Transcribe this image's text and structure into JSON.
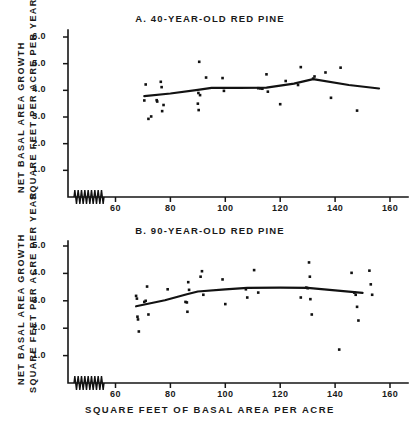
{
  "figure": {
    "xlabel": "SQUARE FEET OF BASAL AREA PER ACRE",
    "ylabel_line1": "NET BASAL AREA  GROWTH",
    "ylabel_line2": "SQUARE FEET PER ACRE PER YEAR",
    "ink_color": "#121212",
    "background": "#ffffff"
  },
  "chart_data": [
    {
      "type": "scatter",
      "title": "A.  40-YEAR-OLD RED PINE",
      "xlabel": "SQUARE FEET OF BASAL AREA PER ACRE",
      "ylabel": "NET BASAL AREA GROWTH, SQUARE FEET PER ACRE PER YEAR",
      "xlim": [
        52,
        165
      ],
      "ylim": [
        0,
        6.6
      ],
      "xticks": [
        60,
        80,
        100,
        120,
        140,
        160
      ],
      "yticks": [
        1.0,
        2.0,
        3.0,
        4.0,
        5.0,
        6.0
      ],
      "xtick_labels": [
        "60",
        "80",
        "100",
        "120",
        "140",
        "160"
      ],
      "ytick_labels": [
        "1.0",
        "2.0",
        "3.0",
        "4.0",
        "5.0",
        "6.0"
      ],
      "grid": false,
      "legend": "none",
      "axis_break": true,
      "points": [
        {
          "x": 71.0,
          "y": 4.22
        },
        {
          "x": 70.5,
          "y": 3.62
        },
        {
          "x": 72.0,
          "y": 2.93
        },
        {
          "x": 73.0,
          "y": 3.02
        },
        {
          "x": 75.0,
          "y": 3.63
        },
        {
          "x": 75.2,
          "y": 3.58
        },
        {
          "x": 76.5,
          "y": 4.32
        },
        {
          "x": 76.8,
          "y": 4.12
        },
        {
          "x": 77.0,
          "y": 3.22
        },
        {
          "x": 77.5,
          "y": 3.45
        },
        {
          "x": 90.5,
          "y": 5.07
        },
        {
          "x": 90.2,
          "y": 3.9
        },
        {
          "x": 90.8,
          "y": 3.82
        },
        {
          "x": 90.0,
          "y": 3.5
        },
        {
          "x": 90.3,
          "y": 3.26
        },
        {
          "x": 93.0,
          "y": 4.48
        },
        {
          "x": 99.0,
          "y": 4.46
        },
        {
          "x": 99.5,
          "y": 3.98
        },
        {
          "x": 112.0,
          "y": 4.08
        },
        {
          "x": 112.8,
          "y": 4.07
        },
        {
          "x": 113.5,
          "y": 4.06
        },
        {
          "x": 115.0,
          "y": 4.6
        },
        {
          "x": 115.5,
          "y": 3.95
        },
        {
          "x": 120.0,
          "y": 3.48
        },
        {
          "x": 122.0,
          "y": 4.35
        },
        {
          "x": 126.5,
          "y": 4.2
        },
        {
          "x": 127.5,
          "y": 4.87
        },
        {
          "x": 132.0,
          "y": 4.44
        },
        {
          "x": 132.5,
          "y": 4.52
        },
        {
          "x": 136.5,
          "y": 4.67
        },
        {
          "x": 138.5,
          "y": 3.72
        },
        {
          "x": 142.0,
          "y": 4.85
        },
        {
          "x": 148.0,
          "y": 3.24
        }
      ],
      "fit_curve": [
        {
          "x": 70.5,
          "y": 3.78
        },
        {
          "x": 80.0,
          "y": 3.88
        },
        {
          "x": 90.0,
          "y": 4.02
        },
        {
          "x": 95.0,
          "y": 4.09
        },
        {
          "x": 105.0,
          "y": 4.09
        },
        {
          "x": 115.0,
          "y": 4.1
        },
        {
          "x": 125.0,
          "y": 4.25
        },
        {
          "x": 132.0,
          "y": 4.42
        },
        {
          "x": 145.0,
          "y": 4.2
        },
        {
          "x": 156.0,
          "y": 4.07
        }
      ]
    },
    {
      "type": "scatter",
      "title": "B.  90-YEAR-OLD RED PINE",
      "xlabel": "SQUARE FEET OF BASAL AREA PER ACRE",
      "ylabel": "NET BASAL AREA GROWTH, SQUARE FEET PER ACRE PER YEAR",
      "xlim": [
        52,
        165
      ],
      "ylim": [
        0,
        5.5
      ],
      "xticks": [
        60,
        80,
        100,
        120,
        140,
        160
      ],
      "yticks": [
        1.0,
        2.0,
        3.0,
        4.0,
        5.0
      ],
      "xtick_labels": [
        "60",
        "80",
        "100",
        "120",
        "140",
        "160"
      ],
      "ytick_labels": [
        "1.0",
        "2.0",
        "3.0",
        "4.0",
        "5.0"
      ],
      "grid": false,
      "legend": "none",
      "axis_break": true,
      "points": [
        {
          "x": 67.5,
          "y": 3.18
        },
        {
          "x": 67.8,
          "y": 3.08
        },
        {
          "x": 68.0,
          "y": 2.42
        },
        {
          "x": 68.2,
          "y": 2.32
        },
        {
          "x": 68.5,
          "y": 1.88
        },
        {
          "x": 70.5,
          "y": 2.96
        },
        {
          "x": 71.0,
          "y": 3.0
        },
        {
          "x": 71.5,
          "y": 3.52
        },
        {
          "x": 72.0,
          "y": 2.5
        },
        {
          "x": 79.0,
          "y": 3.42
        },
        {
          "x": 85.5,
          "y": 2.96
        },
        {
          "x": 86.0,
          "y": 2.94
        },
        {
          "x": 86.5,
          "y": 3.68
        },
        {
          "x": 86.8,
          "y": 3.4
        },
        {
          "x": 86.2,
          "y": 2.6
        },
        {
          "x": 91.5,
          "y": 4.08
        },
        {
          "x": 91.0,
          "y": 3.88
        },
        {
          "x": 92.0,
          "y": 3.22
        },
        {
          "x": 99.0,
          "y": 3.78
        },
        {
          "x": 100.0,
          "y": 2.88
        },
        {
          "x": 107.5,
          "y": 3.42
        },
        {
          "x": 108.0,
          "y": 3.12
        },
        {
          "x": 110.5,
          "y": 4.12
        },
        {
          "x": 112.0,
          "y": 3.3
        },
        {
          "x": 127.5,
          "y": 3.12
        },
        {
          "x": 129.5,
          "y": 3.48
        },
        {
          "x": 130.0,
          "y": 3.46
        },
        {
          "x": 130.5,
          "y": 4.4
        },
        {
          "x": 130.8,
          "y": 3.88
        },
        {
          "x": 131.0,
          "y": 3.06
        },
        {
          "x": 131.5,
          "y": 2.5
        },
        {
          "x": 141.5,
          "y": 1.22
        },
        {
          "x": 146.0,
          "y": 4.02
        },
        {
          "x": 147.0,
          "y": 3.3
        },
        {
          "x": 147.5,
          "y": 3.22
        },
        {
          "x": 148.0,
          "y": 2.78
        },
        {
          "x": 148.5,
          "y": 2.28
        },
        {
          "x": 152.5,
          "y": 4.1
        },
        {
          "x": 153.0,
          "y": 3.6
        },
        {
          "x": 153.5,
          "y": 3.22
        }
      ],
      "fit_curve": [
        {
          "x": 67.5,
          "y": 2.8
        },
        {
          "x": 78.0,
          "y": 3.02
        },
        {
          "x": 86.0,
          "y": 3.24
        },
        {
          "x": 90.0,
          "y": 3.34
        },
        {
          "x": 100.0,
          "y": 3.42
        },
        {
          "x": 108.0,
          "y": 3.47
        },
        {
          "x": 120.0,
          "y": 3.48
        },
        {
          "x": 130.0,
          "y": 3.47
        },
        {
          "x": 140.0,
          "y": 3.38
        },
        {
          "x": 150.0,
          "y": 3.29
        }
      ]
    }
  ]
}
